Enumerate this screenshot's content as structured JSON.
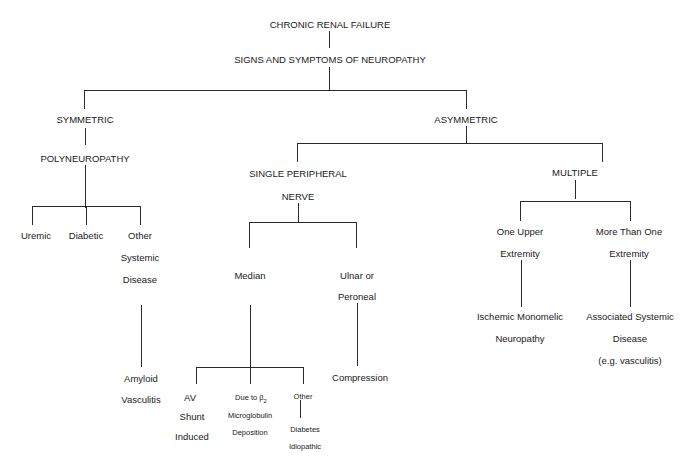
{
  "diagram": {
    "root": "CHRONIC RENAL FAILURE",
    "level1": "SIGNS AND SYMPTOMS OF NEUROPATHY",
    "symmetric": {
      "title": "SYMMETRIC",
      "subtitle": "POLYNEUROPATHY",
      "children": {
        "uremic": "Uremic",
        "diabetic": "Diabetic",
        "other": [
          "Other",
          "Systemic",
          "Disease"
        ],
        "other_children": [
          "Amyloid",
          "Vasculitis"
        ]
      }
    },
    "asymmetric": {
      "title": "ASYMMETRIC",
      "single": {
        "title": [
          "SINGLE PERIPHERAL",
          "NERVE"
        ],
        "median": {
          "label": "Median",
          "children": {
            "av": [
              "AV",
              "Shunt",
              "Induced"
            ],
            "b2m": {
              "line1_prefix": "Due to β",
              "line1_sub": "2",
              "line2": "Microglobulin",
              "line3": "Deposition"
            },
            "other": {
              "label": "Other",
              "children": [
                "Diabetes",
                "Idiopathic"
              ]
            }
          }
        },
        "ulnar": {
          "label": [
            "Ulnar or",
            "Peroneal"
          ],
          "child": "Compression"
        }
      },
      "multiple": {
        "title": "MULTIPLE",
        "one_upper": {
          "label": [
            "One Upper",
            "Extremity"
          ],
          "child": [
            "Ischemic Monomelic",
            "Neuropathy"
          ]
        },
        "more_than_one": {
          "label": [
            "More Than One",
            "Extremity"
          ],
          "child": [
            "Associated Systemic",
            "Disease",
            "(e.g. vasculitis)"
          ]
        }
      }
    }
  }
}
